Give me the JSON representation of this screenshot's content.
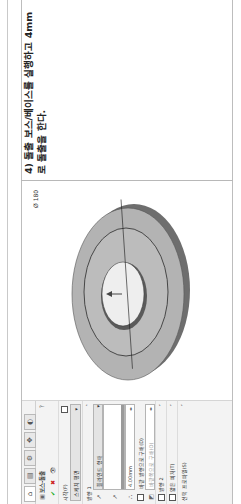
{
  "instruction": {
    "text": "4) 돌출 보스/베이스를 실행하고 4mm로 돌출을 한다."
  },
  "property_manager": {
    "tabs": [
      {
        "icon": "feature-manager-icon",
        "glyph": "⌂"
      },
      {
        "icon": "property-manager-icon",
        "glyph": "▤"
      },
      {
        "icon": "configuration-icon",
        "glyph": "⚙"
      },
      {
        "icon": "dimxpert-icon",
        "glyph": "✥"
      },
      {
        "icon": "display-manager-icon",
        "glyph": "◐"
      }
    ],
    "title": "보스-돌출",
    "help_icon": "?",
    "ok_glyph": "✔",
    "cancel_glyph": "✖",
    "preview_glyph": "👁",
    "from": {
      "label": "시작(F)",
      "value": "스케치 평면"
    },
    "direction1": {
      "label": "방향 1",
      "end_condition": "블라인드 형태",
      "depth": "4.00mm",
      "merge_label": "바깥 방향으로 구배(D)",
      "draft_placeholder": "바깥쪽으로 구배(O)"
    },
    "direction2": {
      "label": "방향 2"
    },
    "thin_feature": {
      "label": "얇은 피처(T)"
    },
    "selected_contours": {
      "label": "선택 프로파일(S)"
    }
  },
  "viewport": {
    "dimension_label": "Ø 180",
    "part_colors": {
      "face": "#b3b3b3",
      "inner_face": "#bdbdbd",
      "edge": "#6e6e6e",
      "hole": "#eeeeee",
      "outline": "#2a2a2a"
    }
  }
}
